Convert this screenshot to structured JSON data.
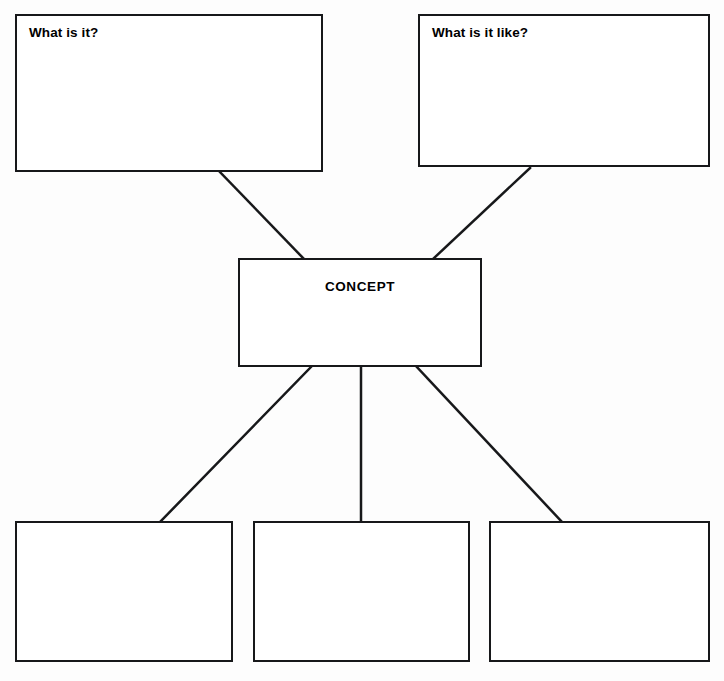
{
  "document": {
    "title": "Concept Map Graphic Organizer",
    "background_color": "#fdfdfd",
    "stroke_color": "#17181a",
    "text_color": "#000000",
    "width": 724,
    "height": 681
  },
  "nodes": [
    {
      "id": "what-is-it",
      "label": "What is it?",
      "label_position": "top-left",
      "filled": false,
      "x": 15,
      "y": 14,
      "width": 308,
      "height": 158
    },
    {
      "id": "what-is-it-like",
      "label": "What is it like?",
      "label_position": "top-left",
      "filled": false,
      "x": 418,
      "y": 14,
      "width": 292,
      "height": 153
    },
    {
      "id": "concept",
      "label": "CONCEPT",
      "label_position": "center",
      "filled": false,
      "x": 238,
      "y": 258,
      "width": 244,
      "height": 109
    },
    {
      "id": "example-1",
      "label": "",
      "label_position": "top-left",
      "filled": false,
      "x": 15,
      "y": 521,
      "width": 218,
      "height": 141
    },
    {
      "id": "example-2",
      "label": "",
      "label_position": "top-left",
      "filled": false,
      "x": 253,
      "y": 521,
      "width": 217,
      "height": 141
    },
    {
      "id": "example-3",
      "label": "",
      "label_position": "top-left",
      "filled": false,
      "x": 489,
      "y": 521,
      "width": 221,
      "height": 141
    }
  ],
  "connectors": [
    {
      "id": "what-is-it-to-concept",
      "from": "what-is-it",
      "to": "concept",
      "x1": 220,
      "y1": 172,
      "x2": 304,
      "y2": 259
    },
    {
      "id": "what-is-it-like-to-concept",
      "from": "what-is-it-like",
      "to": "concept",
      "x1": 530,
      "y1": 168,
      "x2": 433,
      "y2": 259
    },
    {
      "id": "concept-to-example-1",
      "from": "concept",
      "to": "example-1",
      "x1": 312,
      "y1": 366,
      "x2": 160,
      "y2": 522
    },
    {
      "id": "concept-to-example-2",
      "from": "concept",
      "to": "example-2",
      "x1": 361,
      "y1": 366,
      "x2": 361,
      "y2": 522
    },
    {
      "id": "concept-to-example-3",
      "from": "concept",
      "to": "example-3",
      "x1": 416,
      "y1": 366,
      "x2": 562,
      "y2": 522
    }
  ],
  "style": {
    "line_width": 2.5,
    "box_border_width": 2.5
  }
}
